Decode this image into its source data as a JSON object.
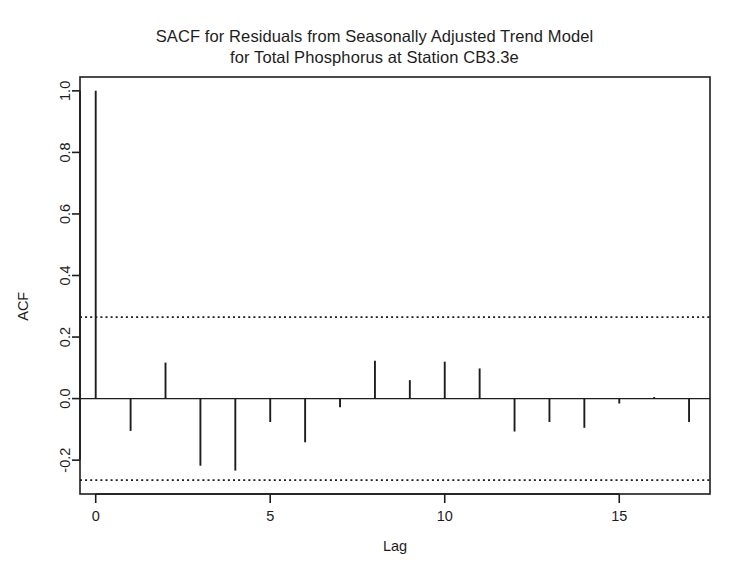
{
  "figure": {
    "title_lines": [
      "SACF for Residuals from Seasonally Adjusted Trend Model",
      "for Total Phosphorus at Station CB3.3e"
    ],
    "background_color": "#ffffff",
    "foreground_color": "#1d1d1d"
  },
  "chart_data": {
    "type": "bar",
    "title": "SACF for Residuals from Seasonally Adjusted Trend Model for Total Phosphorus at Station CB3.3e",
    "xlabel": "Lag",
    "ylabel": "ACF",
    "x": [
      0,
      1,
      2,
      3,
      4,
      5,
      6,
      7,
      8,
      9,
      10,
      11,
      12,
      13,
      14,
      15,
      16,
      17
    ],
    "values": [
      1.0,
      -0.105,
      0.117,
      -0.218,
      -0.234,
      -0.076,
      -0.142,
      -0.028,
      0.123,
      0.06,
      0.12,
      0.098,
      -0.107,
      -0.076,
      -0.095,
      -0.016,
      0.005,
      -0.076
    ],
    "xlim": [
      -0.45,
      17.6
    ],
    "ylim": [
      -0.31,
      1.045
    ],
    "xticks": [
      0,
      5,
      10,
      15
    ],
    "xtick_labels": [
      "0",
      "5",
      "10",
      "15"
    ],
    "yticks": [
      1.0,
      0.8,
      0.6,
      0.4,
      0.2,
      0.0,
      -0.2
    ],
    "ytick_labels": [
      "1.0",
      "0.8",
      "0.6",
      "0.4",
      "0.2",
      "0.0",
      "-0.2"
    ],
    "grid": false,
    "legend": null,
    "zero_line": 0.0,
    "confidence_bands": {
      "upper": 0.265,
      "lower": -0.265,
      "style": "dotted"
    },
    "series_color": "#1d1d1d",
    "bar_style": "vertical-stems"
  }
}
